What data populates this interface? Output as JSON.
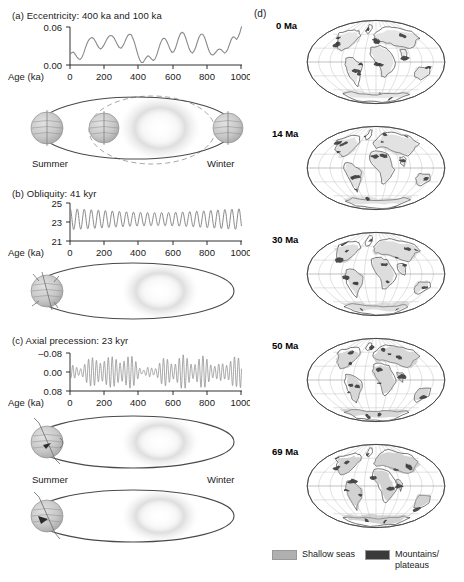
{
  "figure": {
    "panels": [
      {
        "id": "a",
        "label": "(a)",
        "title": "(a) Eccentricity: 400 ka and 100 ka",
        "plot": {
          "ylabel_ticks": [
            "0.06",
            "0.00"
          ],
          "xlabel": "Age (ka)",
          "xticks": [
            "0",
            "200",
            "400",
            "600",
            "800",
            "1000"
          ]
        },
        "orbit": {
          "summer_label": "Summer",
          "winter_label": "Winter"
        }
      },
      {
        "id": "b",
        "label": "(b)",
        "title": "(b) Obliquity: 41 kyr",
        "plot": {
          "ylabel_ticks": [
            "25",
            "23",
            "21"
          ],
          "xlabel": "Age (ka)",
          "xticks": [
            "0",
            "200",
            "400",
            "600",
            "800",
            "1000"
          ]
        }
      },
      {
        "id": "c",
        "label": "(c)",
        "title": "(c) Axial precession: 23 kyr",
        "plot": {
          "ylabel_ticks": [
            "–0.08",
            "0.00",
            "0.08"
          ],
          "xlabel": "Age (ka)",
          "xticks": [
            "0",
            "200",
            "400",
            "600",
            "800",
            "1000"
          ]
        },
        "orbit": {
          "summer_label": "Summer",
          "winter_label": "Winter"
        }
      }
    ],
    "panel_d": {
      "label": "(d)",
      "maps": [
        {
          "label": "0 Ma"
        },
        {
          "label": "14 Ma"
        },
        {
          "label": "30 Ma"
        },
        {
          "label": "50 Ma"
        },
        {
          "label": "69 Ma"
        }
      ],
      "legend": [
        {
          "label": "Shallow seas",
          "color": "#b0b0b0"
        },
        {
          "label": "Mountains/\nplateaus",
          "color": "#3a3a3a"
        }
      ]
    }
  },
  "chart_data": [
    {
      "type": "line",
      "id": "eccentricity",
      "title": "(a) Eccentricity: 400 ka and 100 ka",
      "xlabel": "Age (ka)",
      "ylabel": "",
      "xlim": [
        0,
        1000
      ],
      "ylim": [
        0.0,
        0.06
      ],
      "xticks": [
        0,
        200,
        400,
        600,
        800,
        1000
      ],
      "yticks": [
        0.0,
        0.06
      ],
      "ytick_labels": [
        "0.00",
        "0.06"
      ],
      "grid": false,
      "legend": "none",
      "periods_ka": [
        400,
        100
      ],
      "line_color": "#808080",
      "x": [
        0,
        10,
        20,
        30,
        40,
        50,
        60,
        70,
        80,
        90,
        100,
        110,
        120,
        130,
        140,
        150,
        160,
        170,
        180,
        190,
        200,
        210,
        220,
        230,
        240,
        250,
        260,
        270,
        280,
        290,
        300,
        310,
        320,
        330,
        340,
        350,
        360,
        370,
        380,
        390,
        400,
        410,
        420,
        430,
        440,
        450,
        460,
        470,
        480,
        490,
        500,
        510,
        520,
        530,
        540,
        550,
        560,
        570,
        580,
        590,
        600,
        610,
        620,
        630,
        640,
        650,
        660,
        670,
        680,
        690,
        700,
        710,
        720,
        730,
        740,
        750,
        760,
        770,
        780,
        790,
        800,
        810,
        820,
        830,
        840,
        850,
        860,
        870,
        880,
        890,
        900,
        910,
        920,
        930,
        940,
        950,
        960,
        970,
        980,
        990,
        1000
      ],
      "values": [
        0.017,
        0.019,
        0.02,
        0.017,
        0.013,
        0.01,
        0.009,
        0.012,
        0.018,
        0.026,
        0.033,
        0.038,
        0.041,
        0.042,
        0.04,
        0.036,
        0.031,
        0.027,
        0.025,
        0.027,
        0.031,
        0.036,
        0.041,
        0.044,
        0.045,
        0.044,
        0.041,
        0.036,
        0.031,
        0.027,
        0.026,
        0.029,
        0.034,
        0.04,
        0.045,
        0.047,
        0.046,
        0.041,
        0.034,
        0.025,
        0.016,
        0.009,
        0.005,
        0.005,
        0.009,
        0.013,
        0.015,
        0.013,
        0.01,
        0.008,
        0.01,
        0.016,
        0.024,
        0.032,
        0.038,
        0.041,
        0.04,
        0.036,
        0.03,
        0.024,
        0.02,
        0.021,
        0.026,
        0.034,
        0.042,
        0.048,
        0.05,
        0.048,
        0.042,
        0.034,
        0.026,
        0.021,
        0.019,
        0.022,
        0.028,
        0.036,
        0.043,
        0.047,
        0.047,
        0.043,
        0.036,
        0.028,
        0.021,
        0.017,
        0.016,
        0.018,
        0.021,
        0.024,
        0.025,
        0.024,
        0.021,
        0.019,
        0.02,
        0.026,
        0.034,
        0.041,
        0.044,
        0.043,
        0.04,
        0.043,
        0.05,
        0.058
      ]
    },
    {
      "type": "line",
      "id": "obliquity",
      "title": "(b) Obliquity: 41 kyr",
      "xlabel": "Age (ka)",
      "ylabel": "",
      "xlim": [
        0,
        1000
      ],
      "ylim": [
        21,
        25
      ],
      "xticks": [
        0,
        200,
        400,
        600,
        800,
        1000
      ],
      "yticks": [
        21,
        23,
        25
      ],
      "ytick_labels": [
        "21",
        "23",
        "25"
      ],
      "grid": false,
      "legend": "none",
      "period_kyr": 41,
      "mean": 23.3,
      "amplitude": 1.15,
      "line_color": "#808080"
    },
    {
      "type": "line",
      "id": "axial-precession",
      "title": "(c) Axial precession: 23 kyr",
      "xlabel": "Age (ka)",
      "ylabel": "",
      "xlim": [
        0,
        1000
      ],
      "ylim": [
        -0.08,
        0.08
      ],
      "y_axis_inverted": true,
      "xticks": [
        0,
        200,
        400,
        600,
        800,
        1000
      ],
      "yticks": [
        -0.08,
        0.0,
        0.08
      ],
      "ytick_labels": [
        "–0.08",
        "0.00",
        "0.08"
      ],
      "grid": false,
      "legend": "none",
      "period_kyr": 23,
      "envelope_from": "eccentricity",
      "line_color": "#808080"
    }
  ]
}
